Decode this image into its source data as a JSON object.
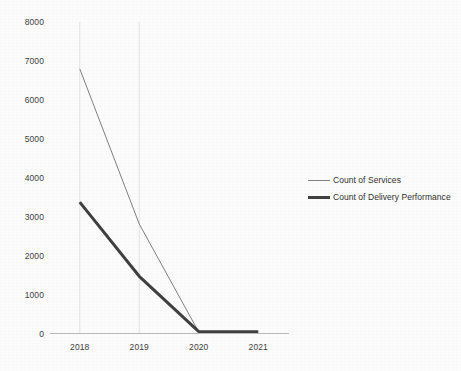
{
  "chart_data": {
    "type": "line",
    "title": "",
    "subtitle": "",
    "xlabel": "",
    "ylabel": "",
    "categories": [
      "2018",
      "2019",
      "2020",
      "2021"
    ],
    "series": [
      {
        "name": "Count of Services",
        "values": [
          6800,
          2820,
          50,
          50
        ],
        "color": "#808080",
        "line_width": 1
      },
      {
        "name": "Count of Delivery Performance",
        "values": [
          3380,
          1480,
          60,
          60
        ],
        "color": "#404040",
        "line_width": 3
      }
    ],
    "ylim": [
      0,
      8000
    ],
    "y_ticks": [
      0,
      1000,
      2000,
      3000,
      4000,
      5000,
      6000,
      7000,
      8000
    ],
    "y_tick_labels": [
      "0",
      "1000",
      "2000",
      "3000",
      "4000",
      "5000",
      "6000",
      "7000",
      "8000"
    ],
    "x_tick_labels": [
      "2018",
      "2019",
      "2020",
      "2021"
    ],
    "grid": {
      "horizontal": false,
      "vertical": true,
      "vertical_at": [
        "2018",
        "2019"
      ],
      "color": "#e3e3e3"
    },
    "legend": {
      "position": "right",
      "entries": [
        {
          "label": "Count of Services",
          "color": "#808080",
          "line_width": 1
        },
        {
          "label": "Count of Delivery Performance",
          "color": "#404040",
          "line_width": 3
        }
      ]
    },
    "axis_line_color": "#b9b9b9",
    "background_color": "#ffffff"
  }
}
